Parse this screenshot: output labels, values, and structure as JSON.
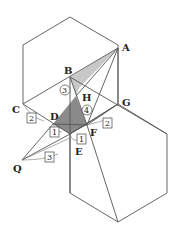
{
  "diagram": {
    "points": {
      "A": {
        "label": "A",
        "x": 118,
        "y": 48
      },
      "B": {
        "label": "B",
        "x": 70,
        "y": 77
      },
      "C": {
        "label": "C",
        "x": 23,
        "y": 104
      },
      "D": {
        "label": "D",
        "x": 53,
        "y": 124
      },
      "E": {
        "label": "E",
        "x": 70,
        "y": 134
      },
      "F": {
        "label": "F",
        "x": 87,
        "y": 125
      },
      "G": {
        "label": "G",
        "x": 118,
        "y": 104
      },
      "H": {
        "label": "H",
        "x": 87,
        "y": 96
      },
      "Q": {
        "label": "Q",
        "x": 22,
        "y": 162
      }
    },
    "ratio_boxes": [
      {
        "text": "2",
        "pos": "C-D"
      },
      {
        "text": "1",
        "pos": "D-E"
      },
      {
        "text": "3",
        "pos": "Q-E"
      },
      {
        "text": "1",
        "pos": "E-F"
      },
      {
        "text": "2",
        "pos": "F-G"
      }
    ],
    "ratio_circles": [
      {
        "text": "3",
        "pos": "B-side"
      },
      {
        "text": "4",
        "pos": "H-F"
      }
    ],
    "colors": {
      "dark_shade": "#8a8a8a",
      "light_shade": "#c8c8c8",
      "line": "#555555"
    }
  }
}
